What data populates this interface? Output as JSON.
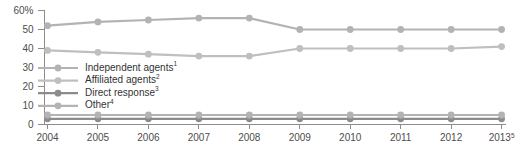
{
  "chart_data": {
    "type": "line",
    "title": "",
    "subtitle": "",
    "xlabel": "",
    "ylabel": "",
    "ylim": [
      0,
      60
    ],
    "yticks": [
      0,
      10,
      20,
      30,
      40,
      50,
      60
    ],
    "ytick_labels": [
      "0",
      "10",
      "20",
      "30",
      "40",
      "50",
      "60%"
    ],
    "grid": false,
    "legend_position": "inside-left",
    "categories": [
      "2004",
      "2005",
      "2006",
      "2007",
      "2008",
      "2009",
      "2010",
      "2011",
      "2012",
      "2013"
    ],
    "xtick_labels": [
      "2004",
      "2005",
      "2006",
      "2007",
      "2008",
      "2009",
      "2010",
      "2011",
      "2012",
      "2013"
    ],
    "xtick_superscripts": [
      "",
      "",
      "",
      "",
      "",
      "",
      "",
      "",
      "",
      "5"
    ],
    "series": [
      {
        "name": "Independent agents",
        "superscript": "1",
        "color": "#b3b3b3",
        "values": [
          52,
          54,
          55,
          56,
          56,
          50,
          50,
          50,
          50,
          50
        ]
      },
      {
        "name": "Affiliated agents",
        "superscript": "2",
        "color": "#bfbfbf",
        "values": [
          39,
          38,
          37,
          36,
          36,
          40,
          40,
          40,
          40,
          41
        ]
      },
      {
        "name": "Direct response",
        "superscript": "3",
        "color": "#8c8c8c",
        "values": [
          3,
          3,
          3,
          3,
          3,
          3,
          3,
          3,
          3,
          3
        ]
      },
      {
        "name": "Other",
        "superscript": "4",
        "color": "#b3b3b3",
        "values": [
          5,
          5,
          5,
          5,
          5,
          5,
          5,
          5,
          5,
          5
        ]
      }
    ]
  },
  "colors": {
    "axis": "#8c8c8c",
    "tick_text": "#4d4d4d",
    "legend_text": "#333333",
    "background": "#ffffff"
  }
}
